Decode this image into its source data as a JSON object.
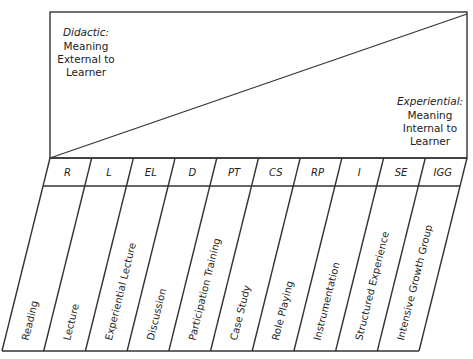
{
  "top_panel": {
    "left_label": {
      "title": "Didactic:",
      "lines": [
        "Meaning",
        "External to",
        "Learner"
      ]
    },
    "right_label": {
      "title": "Experiential:",
      "lines": [
        "Meaning",
        "Internal to",
        "Learner"
      ]
    }
  },
  "columns": [
    {
      "abbr": "R",
      "label": "Reading"
    },
    {
      "abbr": "L",
      "label": "Lecture"
    },
    {
      "abbr": "EL",
      "label": "Experiential Lecture"
    },
    {
      "abbr": "D",
      "label": "Discussion"
    },
    {
      "abbr": "PT",
      "label": "Participation Training"
    },
    {
      "abbr": "CS",
      "label": "Case Study"
    },
    {
      "abbr": "RP",
      "label": "Role Playing"
    },
    {
      "abbr": "I",
      "label": "Instrumentation"
    },
    {
      "abbr": "SE",
      "label": "Structured Experience"
    },
    {
      "abbr": "IGG",
      "label": "Intensive Growth Group"
    }
  ],
  "colors": {
    "line": "#333333",
    "text": "#222222",
    "background": "#ffffff"
  }
}
